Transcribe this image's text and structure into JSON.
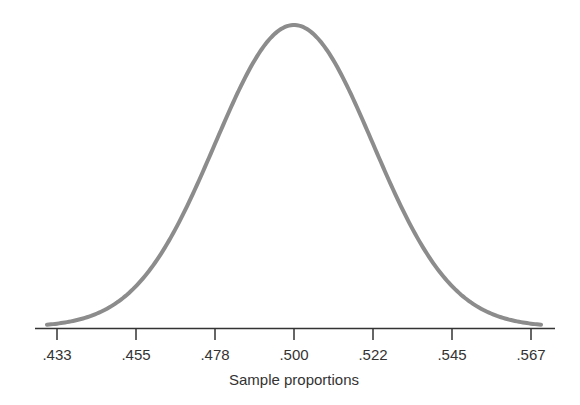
{
  "chart_data": {
    "type": "line",
    "title": "",
    "xlabel": "Sample proportions",
    "ylabel": "",
    "distribution": "normal",
    "mean": 0.5,
    "sd": 0.0225,
    "x_ticks": [
      ".433",
      ".455",
      ".478",
      ".500",
      ".522",
      ".545",
      ".567"
    ],
    "x_tick_values": [
      0.433,
      0.455,
      0.478,
      0.5,
      0.522,
      0.545,
      0.567
    ],
    "xlim": [
      0.428,
      0.572
    ],
    "grid": false,
    "legend": null,
    "colors": {
      "curve": "#8c8c8c",
      "axis": "#333333"
    }
  }
}
